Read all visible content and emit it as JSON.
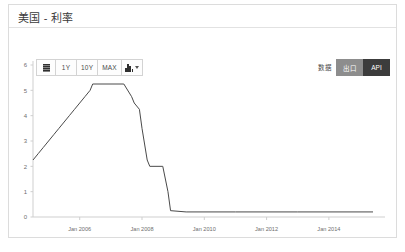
{
  "header": {
    "title": "美国 - 利率"
  },
  "toolbar": {
    "menu_icon": "menu-icon",
    "ranges": [
      {
        "label": "1Y"
      },
      {
        "label": "10Y"
      },
      {
        "label": "MAX"
      }
    ],
    "chart_type_icon": "bar-chart-icon",
    "data_label": "数据",
    "export_label": "出口",
    "api_label": "API"
  },
  "colors": {
    "panel_border": "#dcdcdc",
    "line": "#4a4a4a",
    "axis": "#cfcfcf",
    "export_bg": "#8d8d8d",
    "api_bg": "#3c3c3c",
    "tick_text": "#6e6e6e"
  },
  "chart_data": {
    "type": "line",
    "title": "美国 - 利率",
    "xlabel": "",
    "ylabel": "",
    "ylim": [
      0,
      6
    ],
    "yticks": [
      0,
      1,
      2,
      3,
      4,
      5,
      6
    ],
    "xlim": [
      "2004-07",
      "2015-06"
    ],
    "xticks": [
      "Jan 2006",
      "Jan 2008",
      "Jan 2010",
      "Jan 2012",
      "Jan 2014"
    ],
    "grid": false,
    "legend": "none",
    "series": [
      {
        "name": "Interest Rate",
        "x": [
          "2004-07",
          "2004-09",
          "2004-11",
          "2005-01",
          "2005-03",
          "2005-05",
          "2005-07",
          "2005-09",
          "2005-11",
          "2006-01",
          "2006-03",
          "2006-05",
          "2006-06",
          "2007-06",
          "2007-09",
          "2007-10",
          "2007-12",
          "2008-01",
          "2008-03",
          "2008-04",
          "2008-09",
          "2008-10",
          "2008-11",
          "2008-12",
          "2009-06",
          "2011-01",
          "2013-01",
          "2015-06"
        ],
        "values": [
          2.25,
          2.5,
          2.75,
          3.0,
          3.25,
          3.5,
          3.75,
          4.0,
          4.25,
          4.5,
          4.75,
          5.0,
          5.25,
          5.25,
          4.75,
          4.5,
          4.25,
          3.5,
          2.25,
          2.0,
          2.0,
          1.5,
          1.0,
          0.25,
          0.2,
          0.2,
          0.2,
          0.2
        ]
      }
    ]
  }
}
